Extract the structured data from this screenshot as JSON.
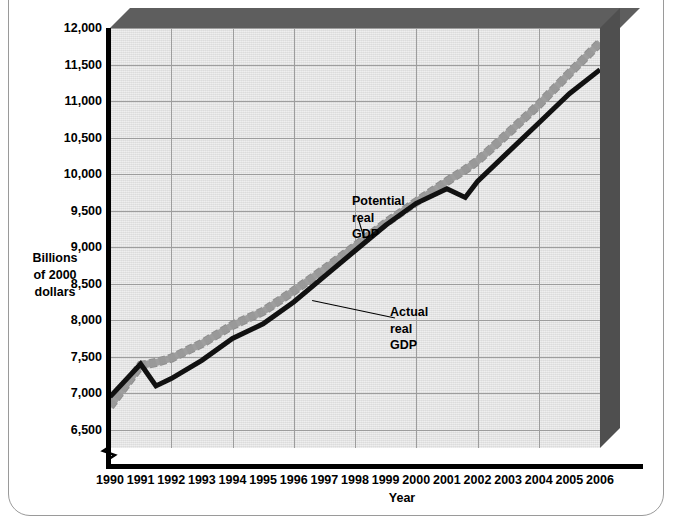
{
  "chart_data": {
    "type": "line",
    "title": "",
    "xlabel": "Year",
    "ylabel": "Billions\nof 2000\ndollars",
    "ylabel_lines": [
      "Billions",
      "of 2000",
      "dollars"
    ],
    "xlim": [
      1990,
      2006
    ],
    "ylim": [
      6250,
      12000
    ],
    "grid": true,
    "axis_break": true,
    "legend_position": "inline-annotations",
    "ytick_labels": [
      "12,000",
      "11,500",
      "11,000",
      "10,500",
      "10,000",
      "9,500",
      "9,000",
      "8,500",
      "8,000",
      "7,500",
      "7,000",
      "6,500"
    ],
    "ytick_values": [
      12000,
      11500,
      11000,
      10500,
      10000,
      9500,
      9000,
      8500,
      8000,
      7500,
      7000,
      6500
    ],
    "xtick_labels": [
      "1990",
      "1991",
      "1992",
      "1993",
      "1994",
      "1995",
      "1996",
      "1997",
      "1998",
      "1999",
      "2000",
      "2001",
      "2002",
      "2003",
      "2004",
      "2005",
      "2006"
    ],
    "xtick_values": [
      1990,
      1991,
      1992,
      1993,
      1994,
      1995,
      1996,
      1997,
      1998,
      1999,
      2000,
      2001,
      2002,
      2003,
      2004,
      2005,
      2006
    ],
    "gridline_years": [
      1990,
      1992,
      1994,
      1996,
      1998,
      2000,
      2002,
      2004,
      2006
    ],
    "x": [
      1990,
      1991,
      1991.5,
      1992,
      1993,
      1994,
      1995,
      1996,
      1997,
      1998,
      1999,
      2000,
      2001,
      2001.6,
      2002,
      2003,
      2004,
      2005,
      2006
    ],
    "series": [
      {
        "name": "Actual real GDP",
        "color": "#111111",
        "style": "solid",
        "values": [
          6950,
          7400,
          7100,
          7200,
          7450,
          7750,
          7950,
          8250,
          8600,
          8950,
          9300,
          9600,
          9800,
          9680,
          9900,
          10300,
          10700,
          11100,
          11430
        ]
      },
      {
        "name": "Potential real GDP",
        "color": "#909090",
        "style": "dashed-band",
        "values": [
          6820,
          7380,
          7420,
          7480,
          7680,
          7930,
          8120,
          8400,
          8700,
          9010,
          9330,
          9620,
          9900,
          10060,
          10180,
          10560,
          10950,
          11380,
          11800
        ]
      }
    ],
    "annotations": [
      {
        "name": "Potential real GDP",
        "text": "Potential\nreal\nGDP",
        "target_year": 1998.3,
        "target_value": 9120
      },
      {
        "name": "Actual real GDP",
        "text": "Actual\nreal\nGDP",
        "target_year": 1996.6,
        "target_value": 8270
      }
    ]
  }
}
